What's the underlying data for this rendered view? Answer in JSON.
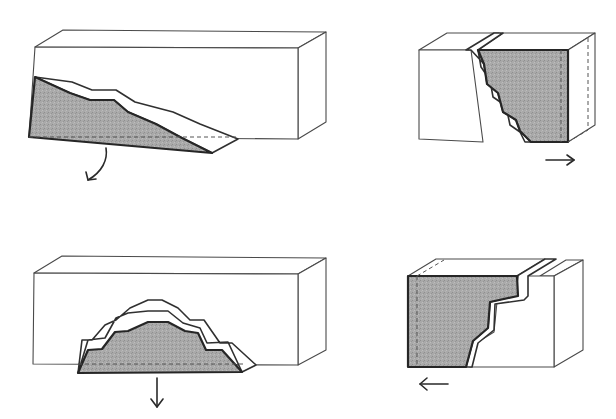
{
  "diagram": {
    "colors": {
      "background": "#ffffff",
      "block_outline": "#4a4a4a",
      "shaded_fill": "#a9a9a9",
      "shaded_outline": "#262626"
    },
    "panels": [
      {
        "id": "top-left",
        "description": "Block with shaded wedge sliding out from lower-left, curved arrow rotating downward",
        "block_front": "35,47 298,48 298,139 29,137",
        "block_top": "35,47 63,30 326,32 298,48",
        "block_side": "298,48 326,32 326,122 298,139",
        "band": "35,77 72,82 92,90 116,90 135,102 173,112 200,124 238,139 212,153 182,138 156,124 128,112 114,100 90,100 70,93",
        "shade": "35,77 70,93 90,100 114,100 128,112 156,124 182,138 212,153 29,137",
        "dash": "29,137 238,137",
        "arrow_path": "M106,148 C108,160 102,172 88,180",
        "arrow_head": "M86,172 L88,180 L96,179",
        "arrow_direction": "rotate-down"
      },
      {
        "id": "top-right",
        "description": "Block with shaded stepped section sliding to the right",
        "block_left_front": "419,50 471,50 483,142 419,139",
        "block_left_top": "419,50 447,33 499,33 471,50",
        "band": "466,50 494,33 503,33 478,50 481,67 490,80 493,97 506,106 510,125 520,132 525,142 531,142 520,131 516,120 503,112 498,93 487,84 484,64 471,50",
        "shade": "478,50 568,50 568,142 531,142 520,131 516,120 503,112 498,93 487,84 484,64",
        "shade_top": "478,50 503,33 595,33 568,50",
        "shade_side": "568,50 595,33 595,125 568,142",
        "dash": "M561,50 L561,142 M568,142 L588,130 M588,38 L588,130",
        "arrow_path": "M546,160 L574,160",
        "arrow_head": "M567,155 L574,160 L567,165",
        "arrow_direction": "right"
      },
      {
        "id": "bottom-left",
        "description": "Block with shaded stepped dome dropping downward",
        "block_front": "34,273 298,274 298,365 33,364",
        "block_top": "34,273 62,256 326,258 298,274",
        "block_side": "298,274 326,258 326,350 298,365",
        "band": "78,373 88,340 105,338 116,318 128,313 148,311 168,311 183,323 200,328 207,343 228,342 242,372 256,365 232,343 220,343 204,320 190,320 178,308 162,300 148,300 130,308 116,320 105,325 92,340 82,340",
        "shade": "78,373 88,350 102,349 115,332 128,331 148,322 168,322 185,331 198,333 206,350 222,350 242,372",
        "dash": "78,364 244,364",
        "arrow_path": "M157,378 L157,407",
        "arrow_head": "M151,399 L157,407 L163,399",
        "arrow_direction": "down"
      },
      {
        "id": "bottom-right",
        "description": "Block with shaded stepped section sliding to the left",
        "block_right_front": "527,276 554,276 554,367 470,367 478,342 494,332 497,302 526,296",
        "block_right_top": "540,276 566,260 583,260 554,276",
        "block_right_side": "554,276 583,260 583,350 554,367",
        "band": "517,276 545,259 556,259 528,276 528,296 524,300 495,304 494,330 478,343 472,367 466,367 473,341 488,328 490,302 515,296 518,276",
        "shade": "408,276 517,276 518,296 490,302 488,328 473,341 466,367 408,367",
        "shade_top": "408,276 436,259 545,259 517,276",
        "dash": "M417,276 L417,367 M417,276 L444,260",
        "arrow_path": "M448,384 L420,384",
        "arrow_head": "M427,378 L420,384 L427,390",
        "arrow_direction": "left"
      }
    ]
  }
}
